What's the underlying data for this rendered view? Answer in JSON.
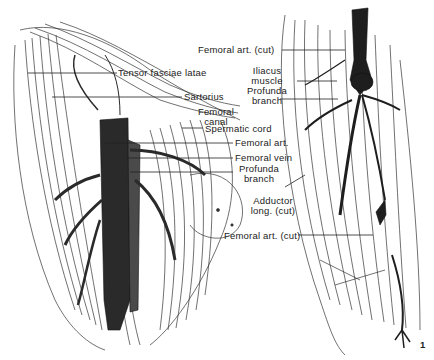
{
  "figure": {
    "left_panel": {
      "labels": [
        {
          "id": "tensor",
          "text": "Tensor fasciae latae"
        },
        {
          "id": "sartorius",
          "text": "Sartorius"
        },
        {
          "id": "femoral_canal_1",
          "text": "Femoral"
        },
        {
          "id": "femoral_canal_2",
          "text": "canal"
        },
        {
          "id": "spermatic",
          "text": "Spermatic cord"
        },
        {
          "id": "fem_art",
          "text": "Femoral art."
        },
        {
          "id": "fem_vein",
          "text": "Femoral vein"
        },
        {
          "id": "profunda_1",
          "text": "Profunda"
        },
        {
          "id": "profunda_2",
          "text": "branch"
        }
      ]
    },
    "right_panel": {
      "labels": [
        {
          "id": "fem_art_cut_top",
          "text": "Femoral art. (cut)"
        },
        {
          "id": "iliacus_1",
          "text": "Iliacus"
        },
        {
          "id": "iliacus_2",
          "text": "muscle"
        },
        {
          "id": "profunda_r1",
          "text": "Profunda"
        },
        {
          "id": "profunda_r2",
          "text": "branch"
        },
        {
          "id": "adductor_1",
          "text": "Adductor"
        },
        {
          "id": "adductor_2",
          "text": "long. (cut)"
        },
        {
          "id": "fem_art_cut_bottom",
          "text": "Femoral art. (cut)"
        }
      ]
    },
    "corner_mark": "1",
    "colors": {
      "ink": "#1a1a1a",
      "vessel": "#2a2a2a",
      "paper": "#ffffff"
    }
  }
}
